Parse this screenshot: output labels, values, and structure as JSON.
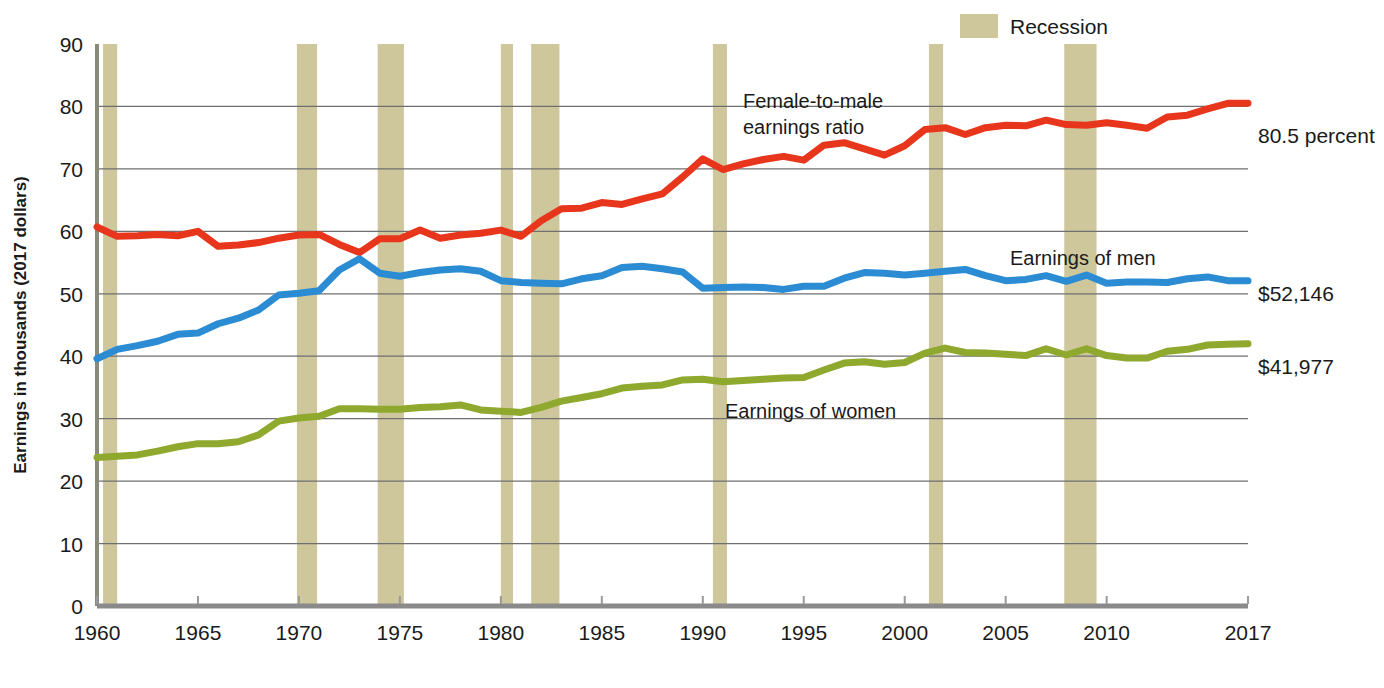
{
  "legend": {
    "position": "top-right",
    "entries": [
      {
        "label": "Recession",
        "swatch_color": "#cfc79c",
        "type": "band"
      }
    ]
  },
  "axes": {
    "y_title": "Earnings in thousands (2017 dollars)",
    "y_ticks": [
      "0",
      "10",
      "20",
      "30",
      "40",
      "50",
      "60",
      "70",
      "80",
      "90"
    ],
    "x_ticks": [
      "1960",
      "1965",
      "1970",
      "1975",
      "1980",
      "1985",
      "1990",
      "1995",
      "2000",
      "2005",
      "2010",
      "2017"
    ],
    "x_label": ""
  },
  "annotations": {
    "ratio_line1": "Female-to-male",
    "ratio_line2": "earnings ratio",
    "men_label": "Earnings of men",
    "women_label": "Earnings of women",
    "ratio_end": "80.5 percent",
    "men_end": "$52,146",
    "women_end": "$41,977"
  },
  "colors": {
    "ratio": "#e8361c",
    "men": "#2b8cd4",
    "women": "#8fa82e",
    "recession": "#cfc79c",
    "grid": "#6f6f6f",
    "axis": "#8a8a7a"
  },
  "chart_data": {
    "type": "line",
    "title": "",
    "subtitle": "",
    "xlabel": "",
    "ylabel": "Earnings in thousands (2017 dollars)",
    "xlim": [
      1960,
      2017
    ],
    "ylim": [
      0,
      90
    ],
    "grid": true,
    "legend_position": "top-right",
    "x": [
      1960,
      1961,
      1962,
      1963,
      1964,
      1965,
      1966,
      1967,
      1968,
      1969,
      1970,
      1971,
      1972,
      1973,
      1974,
      1975,
      1976,
      1977,
      1978,
      1979,
      1980,
      1981,
      1982,
      1983,
      1984,
      1985,
      1986,
      1987,
      1988,
      1989,
      1990,
      1991,
      1992,
      1993,
      1994,
      1995,
      1996,
      1997,
      1998,
      1999,
      2000,
      2001,
      2002,
      2003,
      2004,
      2005,
      2006,
      2007,
      2008,
      2009,
      2010,
      2011,
      2012,
      2013,
      2014,
      2015,
      2016,
      2017
    ],
    "series": [
      {
        "name": "Female-to-male earnings ratio",
        "unit": "percent",
        "color": "#e8361c",
        "end_label": "80.5 percent",
        "values": [
          60.7,
          59.2,
          59.3,
          59.5,
          59.3,
          60.0,
          57.6,
          57.8,
          58.2,
          58.9,
          59.4,
          59.5,
          57.9,
          56.6,
          58.8,
          58.8,
          60.2,
          58.9,
          59.4,
          59.7,
          60.2,
          59.2,
          61.7,
          63.6,
          63.7,
          64.6,
          64.3,
          65.2,
          66.0,
          68.7,
          71.6,
          69.9,
          70.8,
          71.5,
          72.0,
          71.4,
          73.8,
          74.2,
          73.2,
          72.2,
          73.7,
          76.3,
          76.6,
          75.5,
          76.6,
          77.0,
          76.9,
          77.8,
          77.1,
          77.0,
          77.4,
          77.0,
          76.5,
          78.3,
          78.6,
          79.6,
          80.5,
          80.5
        ]
      },
      {
        "name": "Earnings of men",
        "unit": "thousands of 2017 dollars",
        "color": "#2b8cd4",
        "end_label": "$52,146",
        "values": [
          39.6,
          41.1,
          41.7,
          42.4,
          43.5,
          43.7,
          45.2,
          46.1,
          47.4,
          49.8,
          50.1,
          50.5,
          53.8,
          55.6,
          53.3,
          52.8,
          53.4,
          53.8,
          54.0,
          53.6,
          52.1,
          51.8,
          51.7,
          51.6,
          52.4,
          52.9,
          54.2,
          54.4,
          54.0,
          53.5,
          50.9,
          51.0,
          51.1,
          51.0,
          50.7,
          51.2,
          51.2,
          52.5,
          53.4,
          53.3,
          53.0,
          53.3,
          53.6,
          53.9,
          52.9,
          52.1,
          52.3,
          52.9,
          52.0,
          53.0,
          51.7,
          51.9,
          51.9,
          51.8,
          52.4,
          52.7,
          52.1,
          52.1
        ]
      },
      {
        "name": "Earnings of women",
        "unit": "thousands of 2017 dollars",
        "color": "#8fa82e",
        "end_label": "$41,977",
        "values": [
          23.8,
          24.0,
          24.2,
          24.8,
          25.5,
          26.0,
          26.0,
          26.3,
          27.4,
          29.6,
          30.1,
          30.4,
          31.6,
          31.6,
          31.5,
          31.5,
          31.8,
          31.9,
          32.2,
          31.4,
          31.2,
          31.0,
          31.8,
          32.8,
          33.4,
          34.0,
          34.9,
          35.2,
          35.4,
          36.2,
          36.3,
          35.9,
          36.1,
          36.3,
          36.5,
          36.6,
          37.8,
          38.9,
          39.1,
          38.7,
          39.0,
          40.5,
          41.3,
          40.6,
          40.5,
          40.3,
          40.1,
          41.2,
          40.2,
          41.2,
          40.1,
          39.7,
          39.7,
          40.8,
          41.1,
          41.8,
          41.9,
          42.0
        ]
      }
    ],
    "recessions": [
      {
        "start": 1960.3,
        "end": 1961.0
      },
      {
        "start": 1969.9,
        "end": 1970.9
      },
      {
        "start": 1973.9,
        "end": 1975.2
      },
      {
        "start": 1980.0,
        "end": 1980.6
      },
      {
        "start": 1981.5,
        "end": 1982.9
      },
      {
        "start": 1990.5,
        "end": 1991.2
      },
      {
        "start": 2001.2,
        "end": 2001.9
      },
      {
        "start": 2007.9,
        "end": 2009.5
      }
    ]
  }
}
